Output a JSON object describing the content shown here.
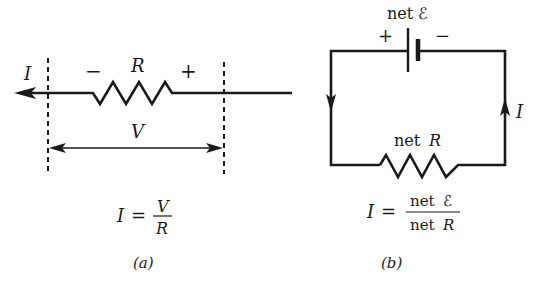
{
  "panel_a": {
    "current_label": "I",
    "minus_sign": "−",
    "resistor_label": "R",
    "plus_sign": "+",
    "voltage_label": "V",
    "formula": {
      "lhs": "I",
      "equals": "=",
      "numerator": "V",
      "denominator": "R"
    },
    "caption": "(a)"
  },
  "panel_b": {
    "battery_label": "net ℰ",
    "plus_sign": "+",
    "minus_sign": "−",
    "resistor_label_prefix": "net",
    "resistor_label_symbol": "R",
    "current_label": "I",
    "formula": {
      "lhs": "I",
      "equals": "=",
      "numerator_prefix": "net",
      "numerator_symbol": "ℰ",
      "denominator_prefix": "net",
      "denominator_symbol": "R"
    },
    "caption": "(b)"
  },
  "colors": {
    "ink": "#1a1a1a",
    "background": "#ffffff"
  }
}
